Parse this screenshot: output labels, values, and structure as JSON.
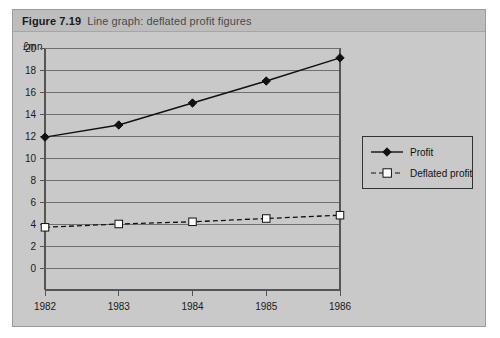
{
  "figure": {
    "number": "Figure 7.19",
    "caption": "Line graph: deflated profit figures"
  },
  "colors": {
    "panel_background": "#c9c9c9",
    "caption_background": "#bdbdbd",
    "panel_border": "#9a9a9a",
    "axis": "#555555",
    "gridline": "#6f6f6f",
    "series_profit": "#111111",
    "series_deflated": "#111111",
    "marker_deflated_fill": "#ffffff",
    "text": "#1a1a1a"
  },
  "legend": {
    "position": "right",
    "entries": [
      {
        "label": "Profit",
        "marker": "filled-diamond",
        "line": "solid"
      },
      {
        "label": "Deflated profit",
        "marker": "open-square",
        "line": "dashed"
      }
    ]
  },
  "axes": {
    "y_title": "£mn",
    "y_ticks": [
      "0",
      "2",
      "4",
      "6",
      "8",
      "10",
      "12",
      "14",
      "16",
      "18",
      "20"
    ],
    "x_ticks": [
      "1982",
      "1983",
      "1984",
      "1985",
      "1986"
    ]
  },
  "chart_data": {
    "type": "line",
    "title": "Line graph: deflated profit figures",
    "xlabel": "",
    "ylabel": "£mn",
    "ylim": [
      0,
      20
    ],
    "ytick_step": 2,
    "grid": true,
    "legend_position": "right",
    "categories": [
      "1982",
      "1983",
      "1984",
      "1985",
      "1986"
    ],
    "series": [
      {
        "name": "Profit",
        "marker": "filled-diamond",
        "line": "solid",
        "values": [
          11.9,
          13.0,
          15.0,
          17.0,
          19.1
        ]
      },
      {
        "name": "Deflated profit",
        "marker": "open-square",
        "line": "dashed",
        "values": [
          3.7,
          4.0,
          4.2,
          4.5,
          4.8
        ]
      }
    ]
  }
}
